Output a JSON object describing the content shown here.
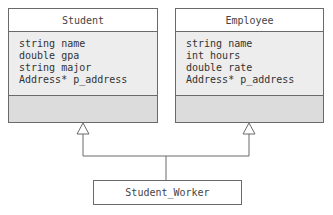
{
  "diagram": {
    "type": "UML class diagram (multiple inheritance)",
    "classes": [
      {
        "name": "Student",
        "attributes": [
          "string name",
          "double gpa",
          "string major",
          "Address* p_address"
        ],
        "methods": []
      },
      {
        "name": "Employee",
        "attributes": [
          "string name",
          "int hours",
          "double rate",
          "Address* p_address"
        ],
        "methods": []
      },
      {
        "name": "Student_Worker"
      }
    ],
    "relationships": [
      {
        "from": "Student_Worker",
        "to": "Student",
        "type": "generalization"
      },
      {
        "from": "Student_Worker",
        "to": "Employee",
        "type": "generalization"
      }
    ],
    "colors": {
      "border": "#6a6a6a",
      "header_bg": "#ffffff",
      "attributes_bg": "#ededed",
      "methods_bg": "#dcdcdc",
      "text": "#333333"
    }
  }
}
